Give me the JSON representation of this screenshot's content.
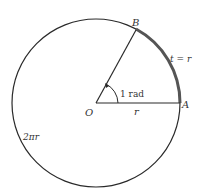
{
  "diagram": {
    "labels": {
      "point_b": "B",
      "point_o": "O",
      "point_a": "A",
      "arc_length": "t = r",
      "angle": "1 rad",
      "radius": "r",
      "circumference": "2πr"
    },
    "colors": {
      "stroke": "#2a2a2a",
      "arc_highlight": "#555555",
      "background": "#ffffff"
    },
    "geometry": {
      "center": [
        95,
        103
      ],
      "radius": 85,
      "angle_rad": 1
    }
  }
}
